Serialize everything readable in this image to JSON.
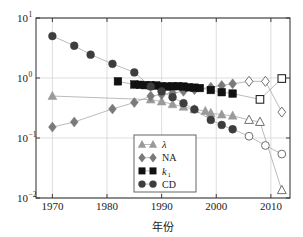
{
  "chart_data": {
    "type": "scatter",
    "title": "",
    "subtitle": "",
    "xlabel": "年份",
    "ylabel": "",
    "xlim": [
      1967,
      2013.5
    ],
    "ylim": [
      0.01,
      10
    ],
    "yscale": "log",
    "xscale": "linear",
    "grid": true,
    "legend_position": "lower-center",
    "xticks": [
      1970,
      1980,
      1990,
      2000,
      2010
    ],
    "xtick_labels": [
      "1970",
      "1980",
      "1990",
      "2000",
      "2010"
    ],
    "yticks": [
      0.01,
      0.1,
      1,
      10
    ],
    "ytick_labels": [
      "10⁻²",
      "10⁻¹",
      "10⁰",
      "10¹"
    ],
    "ytick_mantissa": [
      "10",
      "10",
      "10",
      "10"
    ],
    "ytick_exponent": [
      "-2",
      "-1",
      "0",
      "1"
    ],
    "series": [
      {
        "name": "λ",
        "label": "λ",
        "marker": "triangle",
        "color": "#9a9a9a",
        "x": [
          1970,
          1988,
          1990,
          1992,
          1994,
          1996,
          1998,
          1999,
          2001,
          2003,
          2006,
          2008,
          2012
        ],
        "y": [
          0.5,
          0.436,
          0.405,
          0.365,
          0.33,
          0.3,
          0.28,
          0.26,
          0.245,
          0.235,
          0.2,
          0.185,
          0.0135
        ],
        "filled": [
          true,
          true,
          true,
          true,
          true,
          true,
          true,
          true,
          true,
          true,
          false,
          false,
          false
        ]
      },
      {
        "name": "NA",
        "label": "NA",
        "marker": "diamond",
        "color": "#7a7a7a",
        "x": [
          1970,
          1974,
          1981,
          1985,
          1988,
          1990,
          1992,
          1994,
          1996,
          1999,
          2001,
          2003,
          2006,
          2009,
          2012
        ],
        "y": [
          0.152,
          0.185,
          0.305,
          0.39,
          0.5,
          0.53,
          0.56,
          0.6,
          0.64,
          0.7,
          0.75,
          0.8,
          0.88,
          0.88,
          0.27
        ],
        "filled": [
          true,
          true,
          true,
          true,
          true,
          true,
          true,
          true,
          true,
          true,
          true,
          true,
          false,
          false,
          false
        ]
      },
      {
        "name": "k₁",
        "label": "k",
        "label_sub": "1",
        "marker": "square",
        "color": "#111111",
        "x": [
          1982,
          1985,
          1986,
          1987,
          1988,
          1989,
          1990,
          1991,
          1992,
          1993,
          1994,
          1995,
          1996,
          1997,
          1999,
          2001,
          2003,
          2008,
          2012
        ],
        "y": [
          0.88,
          0.78,
          0.77,
          0.76,
          0.76,
          0.75,
          0.73,
          0.72,
          0.73,
          0.73,
          0.72,
          0.7,
          0.69,
          0.68,
          0.63,
          0.58,
          0.55,
          0.44,
          0.98
        ],
        "filled": [
          true,
          true,
          true,
          true,
          true,
          true,
          true,
          true,
          true,
          true,
          true,
          true,
          true,
          true,
          true,
          true,
          true,
          false,
          false
        ]
      },
      {
        "name": "CD",
        "label": "CD",
        "marker": "circle",
        "color": "#3d3d3d",
        "x": [
          1970,
          1974,
          1977,
          1981,
          1985,
          1988,
          1990,
          1992,
          1994,
          1996,
          1999,
          2001,
          2003,
          2006,
          2009,
          2012
        ],
        "y": [
          5.0,
          3.45,
          2.45,
          1.72,
          1.24,
          0.72,
          0.6,
          0.48,
          0.38,
          0.3,
          0.2,
          0.165,
          0.14,
          0.107,
          0.075,
          0.054
        ],
        "filled": [
          true,
          true,
          true,
          true,
          true,
          true,
          true,
          true,
          true,
          true,
          true,
          true,
          true,
          false,
          false,
          false
        ]
      }
    ],
    "legend_entries": [
      {
        "label": "λ",
        "marker": "triangle",
        "color": "#9a9a9a",
        "italic": true
      },
      {
        "label": "NA",
        "marker": "diamond",
        "color": "#7a7a7a",
        "italic": false
      },
      {
        "label": "k",
        "label_sub": "1",
        "marker": "square",
        "color": "#111111",
        "italic": true
      },
      {
        "label": "CD",
        "marker": "circle",
        "color": "#3d3d3d",
        "italic": false
      }
    ]
  },
  "axes": {
    "x_title": "年份",
    "x_tick_labels": [
      "1970",
      "1980",
      "1990",
      "2000",
      "2010"
    ],
    "y_tick_mantissa": "10",
    "y_tick_exponents": [
      "1",
      "0",
      "-1",
      "-2"
    ]
  },
  "colors": {
    "lambda": "#9a9a9a",
    "na": "#7a7a7a",
    "k1": "#111111",
    "cd": "#3d3d3d",
    "axis": "#2b2b2b",
    "grid": "#d0d0d0",
    "background": "#ffffff"
  }
}
